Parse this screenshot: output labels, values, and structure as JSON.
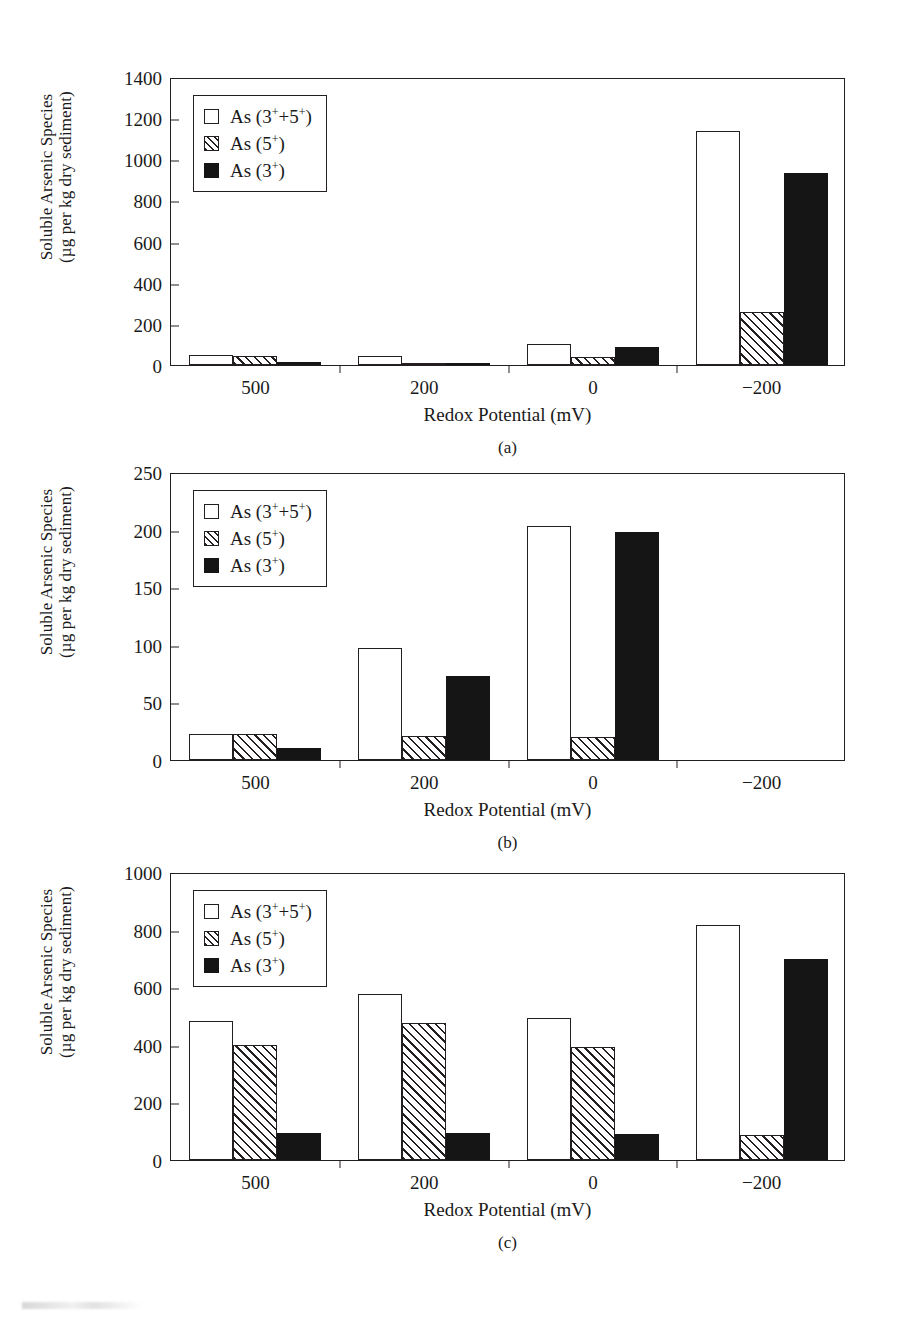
{
  "figure": {
    "axis_titles": {
      "y_line1": "Soluble Arsenic Species",
      "y_line2": "(µg per kg dry sediment)",
      "x": "Redox Potential (mV)"
    },
    "legend": {
      "items": [
        {
          "key": "total",
          "fill": "open",
          "label_prefix": "As (3",
          "sup1": "+",
          "mid": "+5",
          "sup2": "+",
          "suffix": ")",
          "label": "As (3⁺+5⁺)"
        },
        {
          "key": "as5",
          "fill": "hatch",
          "label": "As (5⁺)"
        },
        {
          "key": "as3",
          "fill": "solid",
          "label": "As (3⁺)"
        }
      ]
    }
  },
  "chart_data": [
    {
      "id": "a",
      "type": "bar",
      "title": "",
      "subcaption": "(a)",
      "xlabel": "Redox Potential (mV)",
      "ylabel": "Soluble Arsenic Species (µg per kg dry sediment)",
      "categories": [
        "500",
        "200",
        "0",
        "−200"
      ],
      "ylim": [
        0,
        1400
      ],
      "yticks": [
        0,
        200,
        400,
        600,
        800,
        1000,
        1200,
        1400
      ],
      "grid": false,
      "legend_position": "top-left",
      "series": [
        {
          "name": "As (3⁺+5⁺)",
          "fill": "open",
          "values": [
            50,
            45,
            100,
            1140
          ]
        },
        {
          "name": "As (5⁺)",
          "fill": "hatch",
          "values": [
            45,
            10,
            40,
            260
          ]
        },
        {
          "name": "As (3⁺)",
          "fill": "solid",
          "values": [
            15,
            12,
            90,
            935
          ]
        }
      ]
    },
    {
      "id": "b",
      "type": "bar",
      "title": "",
      "subcaption": "(b)",
      "xlabel": "Redox Potential (mV)",
      "ylabel": "Soluble Arsenic Species (µg per kg dry sediment)",
      "categories": [
        "500",
        "200",
        "0",
        "−200"
      ],
      "ylim": [
        0,
        250
      ],
      "yticks": [
        0,
        50,
        100,
        150,
        200,
        250
      ],
      "grid": false,
      "legend_position": "top-left",
      "series": [
        {
          "name": "As (3⁺+5⁺)",
          "fill": "open",
          "values": [
            23,
            97,
            203,
            0
          ]
        },
        {
          "name": "As (5⁺)",
          "fill": "hatch",
          "values": [
            23,
            21,
            20,
            0
          ]
        },
        {
          "name": "As (3⁺)",
          "fill": "solid",
          "values": [
            10,
            73,
            198,
            0
          ]
        }
      ]
    },
    {
      "id": "c",
      "type": "bar",
      "title": "",
      "subcaption": "(c)",
      "xlabel": "Redox Potential (mV)",
      "ylabel": "Soluble Arsenic Species (µg per kg dry sediment)",
      "categories": [
        "500",
        "200",
        "0",
        "−200"
      ],
      "ylim": [
        0,
        1000
      ],
      "yticks": [
        0,
        200,
        400,
        600,
        800,
        1000
      ],
      "grid": false,
      "legend_position": "top-left",
      "series": [
        {
          "name": "As (3⁺+5⁺)",
          "fill": "open",
          "values": [
            482,
            578,
            492,
            815
          ]
        },
        {
          "name": "As (5⁺)",
          "fill": "hatch",
          "values": [
            400,
            475,
            393,
            88
          ]
        },
        {
          "name": "As (3⁺)",
          "fill": "solid",
          "values": [
            95,
            93,
            90,
            697
          ]
        }
      ]
    }
  ]
}
